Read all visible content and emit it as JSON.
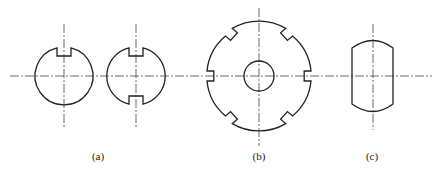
{
  "figure": {
    "labels": [
      {
        "id": "a",
        "text": "(a)",
        "x": 98,
        "y": 157
      },
      {
        "id": "b",
        "text": "(b)",
        "x": 259,
        "y": 157
      },
      {
        "id": "c",
        "text": "(c)",
        "x": 372,
        "y": 157
      }
    ],
    "colors": {
      "stroke": "#222222",
      "centerline": "#444444",
      "background": "#ffffff"
    }
  }
}
